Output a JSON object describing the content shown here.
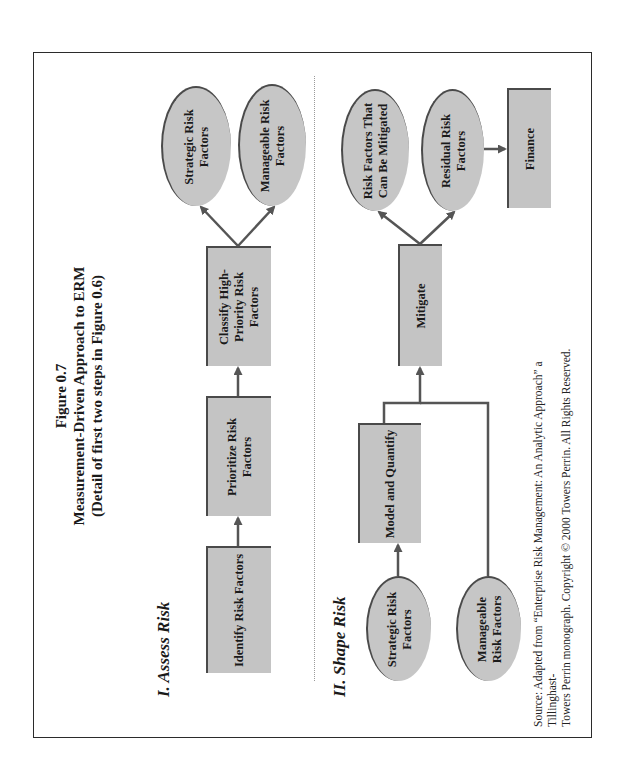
{
  "figure": {
    "number": "Figure 0.7",
    "title": "Measurement-Driven Approach to ERM",
    "subtitle": "(Detail of first two steps in Figure 0.6)",
    "orientation": "rotated 90° counter-clockwise"
  },
  "sections": {
    "assess": {
      "label_prefix": "I. ",
      "label_emphasis": "Assess Risk",
      "label_plain": "I. Assess",
      "label_italic": " Risk",
      "nodes": {
        "identify": "Identify Risk Factors",
        "prioritize": "Prioritize Risk Factors",
        "classify": "Classify High-Priority Risk Factors",
        "strategic": "Strategic Risk Factors",
        "manageable": "Manageable Risk Factors"
      }
    },
    "shape": {
      "label_plain": "II. Shape",
      "label_italic": " Risk",
      "nodes": {
        "strategic": "Strategic Risk Factors",
        "manageable": "Manageable Risk Factors",
        "model": "Model and Quantify",
        "mitigate": "Mitigate",
        "mitigable": "Risk Factors That Can Be Mitigated",
        "residual": "Residual Risk Factors",
        "finance": "Finance"
      }
    }
  },
  "edges": [
    {
      "from": "Identify Risk Factors",
      "to": "Prioritize Risk Factors"
    },
    {
      "from": "Prioritize Risk Factors",
      "to": "Classify High-Priority Risk Factors"
    },
    {
      "from": "Classify High-Priority Risk Factors",
      "to": "Strategic Risk Factors"
    },
    {
      "from": "Classify High-Priority Risk Factors",
      "to": "Manageable Risk Factors"
    },
    {
      "from": "Strategic Risk Factors (II)",
      "to": "Model and Quantify"
    },
    {
      "from": "Model and Quantify",
      "to": "Mitigate"
    },
    {
      "from": "Manageable Risk Factors (II)",
      "to": "Mitigate"
    },
    {
      "from": "Mitigate",
      "to": "Risk Factors That Can Be Mitigated"
    },
    {
      "from": "Mitigate",
      "to": "Residual Risk Factors"
    },
    {
      "from": "Residual Risk Factors",
      "to": "Finance"
    }
  ],
  "source": {
    "line1": "Source: Adapted from “Enterprise Risk Management: An Analytic Approach” a Tillinghast-",
    "line2": "Towers Perrin monograph. Copyright © 2000 Towers Perrin.  All Rights Reserved."
  },
  "colors": {
    "node_fill": "#c4c4c4",
    "node_edge": "#4a4a4a",
    "arrow": "#555555",
    "frame": "#2b2b2b"
  }
}
